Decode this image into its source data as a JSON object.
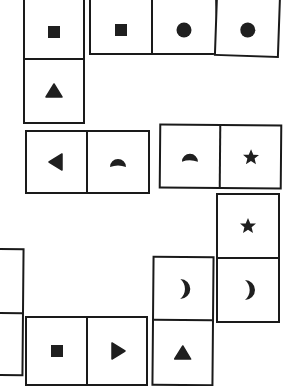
{
  "title": "Domino symbol puzzle",
  "colors": {
    "stroke": "#1a1a1a",
    "fill": "#1f1f1f",
    "background": "#ffffff"
  },
  "tiles": [
    {
      "id": "A",
      "orientation": "vertical",
      "x": 23,
      "y": -4,
      "w": 62,
      "h": 128,
      "rotate": 0,
      "divider": 62,
      "cells": [
        {
          "symbol": "square"
        },
        {
          "symbol": "triangle-up"
        }
      ]
    },
    {
      "id": "B",
      "orientation": "horizontal",
      "x": 89,
      "y": -6,
      "w": 128,
      "h": 61,
      "rotate": 0,
      "divider": 62,
      "cells": [
        {
          "symbol": "square"
        },
        {
          "symbol": "circle"
        }
      ]
    },
    {
      "id": "C",
      "orientation": "vertical",
      "x": 215,
      "y": -8,
      "w": 65,
      "h": 65,
      "rotate": 2,
      "divider": null,
      "cells": [
        {
          "symbol": "circle"
        }
      ]
    },
    {
      "id": "D",
      "orientation": "horizontal",
      "x": 25,
      "y": 130,
      "w": 125,
      "h": 64,
      "rotate": 0,
      "divider": 61,
      "cells": [
        {
          "symbol": "triangle-left"
        },
        {
          "symbol": "half-moon-top"
        }
      ]
    },
    {
      "id": "E",
      "orientation": "horizontal",
      "x": 159,
      "y": 124,
      "w": 123,
      "h": 65,
      "rotate": 0.5,
      "divider": 60,
      "cells": [
        {
          "symbol": "half-moon-top"
        },
        {
          "symbol": "star"
        }
      ]
    },
    {
      "id": "F",
      "orientation": "vertical",
      "x": 216,
      "y": 193,
      "w": 64,
      "h": 130,
      "rotate": 0,
      "divider": 64,
      "cells": [
        {
          "symbol": "star"
        },
        {
          "symbol": "crescent-right"
        }
      ]
    },
    {
      "id": "G",
      "orientation": "vertical",
      "x": 152,
      "y": 256,
      "w": 62,
      "h": 130,
      "rotate": 0.5,
      "divider": 63,
      "cells": [
        {
          "symbol": "crescent-right"
        },
        {
          "symbol": "triangle-up"
        }
      ]
    },
    {
      "id": "H",
      "orientation": "horizontal",
      "x": 25,
      "y": 316,
      "w": 123,
      "h": 70,
      "rotate": 0,
      "divider": 61,
      "cells": [
        {
          "symbol": "square"
        },
        {
          "symbol": "triangle-right"
        }
      ]
    },
    {
      "id": "I",
      "orientation": "vertical",
      "x": -40,
      "y": 248,
      "w": 64,
      "h": 128,
      "rotate": 0.5,
      "divider": 64,
      "cells": [
        {
          "symbol": "none"
        },
        {
          "symbol": "none"
        }
      ]
    }
  ]
}
